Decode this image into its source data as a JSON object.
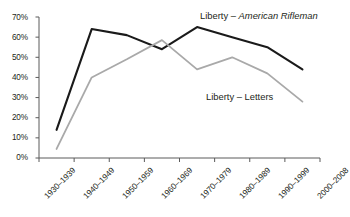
{
  "chart_data": {
    "type": "line",
    "title": "",
    "xlabel": "",
    "ylabel": "",
    "ylim": [
      0,
      70
    ],
    "ytick_labels": [
      "70%",
      "60%",
      "50%",
      "40%",
      "30%",
      "20%",
      "10%",
      "0%"
    ],
    "ytick_values": [
      70,
      60,
      50,
      40,
      30,
      20,
      10,
      0
    ],
    "grid": false,
    "legend_position": "inline-annotations",
    "categories": [
      "1930–1939",
      "1940–1949",
      "1950–1959",
      "1960–1969",
      "1970–1979",
      "1980–1989",
      "1990–1999",
      "2000–2008"
    ],
    "series": [
      {
        "name": "Liberty – American Rifleman",
        "name_prefix": "Liberty – ",
        "name_italic_part": "American Rifleman",
        "color": "#1a1a1a",
        "values": [
          14,
          64,
          61,
          54,
          65,
          60,
          55,
          44
        ]
      },
      {
        "name": "Liberty – Letters",
        "name_prefix": "Liberty – Letters",
        "name_italic_part": "",
        "color": "#a9a9a9",
        "values": [
          4.5,
          40,
          49,
          58.5,
          44,
          50,
          42,
          28
        ]
      }
    ],
    "annotations": [
      {
        "text": "Liberty – American Rifleman",
        "x_px": 202,
        "y_px": 12
      },
      {
        "text": "Liberty – Letters",
        "x_px": 208,
        "y_px": 93
      }
    ],
    "axis_color": "#5a5a5a"
  }
}
